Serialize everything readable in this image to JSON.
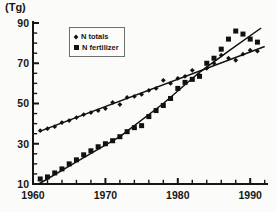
{
  "chart_data": {
    "type": "scatter",
    "title": "",
    "xlabel": "",
    "ylabel": "(Tg)",
    "xlim": [
      1960,
      1992.5
    ],
    "ylim": [
      10,
      90
    ],
    "x_major_ticks": [
      1960,
      1970,
      1980,
      1990
    ],
    "x_minor_tick_step": 2,
    "y_major_ticks": [
      10,
      30,
      50,
      70,
      90
    ],
    "y_minor_tick_step": 5,
    "grid": false,
    "axis_color": "#161616",
    "marker_color": "#111111",
    "legend": {
      "position": "upper-left-inside",
      "border": true
    },
    "x": [
      1961,
      1962,
      1963,
      1964,
      1965,
      1966,
      1967,
      1968,
      1969,
      1970,
      1971,
      1972,
      1973,
      1974,
      1975,
      1976,
      1977,
      1978,
      1979,
      1980,
      1981,
      1982,
      1983,
      1984,
      1985,
      1986,
      1987,
      1988,
      1989,
      1990,
      1991
    ],
    "series": [
      {
        "name": "N totals",
        "marker": "diamond",
        "values": [
          36.5,
          37.5,
          38.5,
          40.5,
          41.5,
          43,
          44.5,
          45.5,
          46.5,
          47.5,
          50.5,
          49.5,
          53,
          53.5,
          54.5,
          56.5,
          57.5,
          61.5,
          60,
          62.5,
          63.5,
          66.5,
          64,
          67.5,
          70,
          74,
          72.5,
          71.5,
          74.5,
          76.5,
          76
        ],
        "trend_line": [
          [
            1961,
            36.3
          ],
          [
            1992,
            78.3
          ]
        ]
      },
      {
        "name": "N fertilizer",
        "marker": "square",
        "values": [
          12.5,
          13.5,
          15.5,
          17.5,
          20,
          22,
          24.5,
          26.5,
          28.5,
          30,
          31.5,
          33.5,
          36,
          38,
          39,
          43.5,
          46.5,
          49,
          52.5,
          57.5,
          60.5,
          62,
          63.5,
          70,
          72.5,
          77,
          82,
          86,
          84.5,
          82,
          80.5
        ],
        "trend_line": [
          [
            1960.8,
            10
          ],
          [
            1966,
            21
          ],
          [
            1972,
            33.5
          ],
          [
            1978,
            50
          ],
          [
            1983,
            65.5
          ],
          [
            1987,
            76
          ],
          [
            1991.5,
            87.5
          ]
        ]
      }
    ]
  }
}
